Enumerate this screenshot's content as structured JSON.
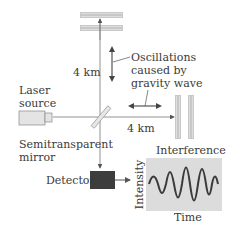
{
  "diagram": {
    "labels": {
      "top_arm_length": "4 km",
      "right_arm_length": "4 km",
      "oscillations_line1": "Oscillations",
      "oscillations_line2": "caused by",
      "oscillations_line3": "gravity wave",
      "laser_line1": "Laser",
      "laser_line2": "source",
      "mirror_line1": "Semitransparent",
      "mirror_line2": "mirror",
      "detector": "Detector",
      "graph_title": "Interference",
      "graph_ylabel": "Intensity",
      "graph_xlabel": "Time"
    },
    "components": [
      {
        "id": "laser-source",
        "name": "Laser source"
      },
      {
        "id": "beam-splitter",
        "name": "Semitransparent mirror"
      },
      {
        "id": "top-mirror-pair",
        "name": "Vertical arm mirrors"
      },
      {
        "id": "right-mirror-pair",
        "name": "Horizontal arm mirrors"
      },
      {
        "id": "detector",
        "name": "Detector"
      },
      {
        "id": "interference-graph",
        "name": "Interference pattern"
      }
    ],
    "colors": {
      "beam": "#777777",
      "detector": "#3d3d3d",
      "graph_bg": "#dcdcdc",
      "waveform": "#3a3a3a",
      "laser_body": "#e4e4e4"
    }
  }
}
